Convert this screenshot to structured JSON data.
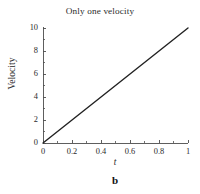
{
  "figure": {
    "title": "Only one velocity",
    "caption": "b",
    "background_color": "#ffffff",
    "axis_color": "#4d4d4d",
    "line_color": "#222222"
  },
  "chart_data": {
    "type": "line",
    "title": "Only one velocity",
    "xlabel": "t",
    "ylabel": "Velocity",
    "xlim": [
      0,
      1
    ],
    "ylim": [
      0,
      10
    ],
    "grid": false,
    "legend": false,
    "xticks": [
      0,
      0.2,
      0.4,
      0.6,
      0.8,
      1
    ],
    "xtick_labels": [
      "0",
      "0.2",
      "0.4",
      "0.6",
      "0.8",
      "1"
    ],
    "yticks": [
      0,
      2,
      4,
      6,
      8,
      10
    ],
    "ytick_labels": [
      "0",
      "2",
      "4",
      "6",
      "8",
      "10"
    ],
    "x_minor_tick_count": 1,
    "y_minor_tick_count": 1,
    "series": [
      {
        "name": "velocity",
        "color": "#222222",
        "linewidth": 1.4,
        "x": [
          0,
          0.1,
          0.2,
          0.3,
          0.4,
          0.5,
          0.6,
          0.7,
          0.8,
          0.9,
          1
        ],
        "values": [
          0,
          1,
          2,
          3,
          4,
          5,
          6,
          7,
          8,
          9,
          10
        ]
      }
    ],
    "annotations": [
      {
        "text": "b",
        "role": "panel-label",
        "position": "below-axis-center"
      }
    ]
  }
}
